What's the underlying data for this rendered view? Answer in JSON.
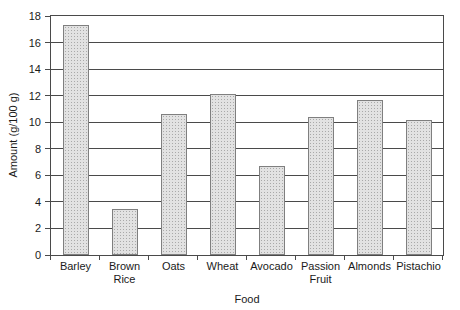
{
  "chart_data": {
    "type": "bar",
    "title": "",
    "xlabel": "Food",
    "ylabel": "Amount (g/100 g)",
    "categories": [
      "Barley",
      "Brown Rice",
      "Oats",
      "Wheat",
      "Avocado",
      "Passion Fruit",
      "Almonds",
      "Pistachio"
    ],
    "values": [
      17.3,
      3.5,
      10.6,
      12.1,
      6.7,
      10.4,
      11.7,
      10.2
    ],
    "series": [
      {
        "name": "Amount (g/100 g)",
        "values": [
          17.3,
          3.5,
          10.6,
          12.1,
          6.7,
          10.4,
          11.7,
          10.2
        ]
      }
    ],
    "ylim": [
      0,
      18
    ],
    "yticks": [
      0,
      2,
      4,
      6,
      8,
      10,
      12,
      14,
      16,
      18
    ],
    "grid": "horizontal",
    "legend": "none",
    "colors": {
      "background": "#ffffff",
      "axis_line": "#4a4a4a",
      "gridline": "#4a4a4a",
      "bar_fill_base": "#e2e2e2",
      "bar_fill_dot": "#a9a9a9",
      "bar_border": "#7f7f7f",
      "text": "#1a1a1a"
    }
  }
}
